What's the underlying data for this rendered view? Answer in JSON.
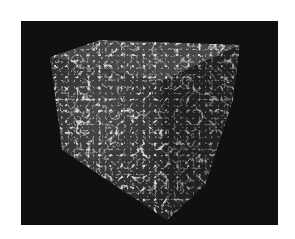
{
  "image": {
    "description": "3D volume rendering of a cube with filamentary web-like structure",
    "background_color": "#ffffff",
    "panel_color": "#101010",
    "filament_color": "#e6e6e6",
    "cube_base_color": "#3a3a3a"
  }
}
